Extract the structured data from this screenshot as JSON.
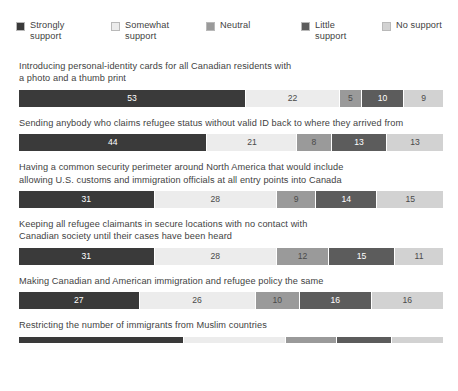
{
  "legend": {
    "items": [
      {
        "label": "Strongly\nsupport",
        "key": "strongly",
        "color": "#3a3a3a",
        "swatch_name": "legend-swatch-strongly-support"
      },
      {
        "label": "Somewhat\nsupport",
        "key": "somewhat",
        "color": "#ececec",
        "swatch_name": "legend-swatch-somewhat-support"
      },
      {
        "label": "Neutral",
        "key": "neutral",
        "color": "#9a9a9a",
        "swatch_name": "legend-swatch-neutral"
      },
      {
        "label": "Little\nsupport",
        "key": "little",
        "color": "#5c5c5c",
        "swatch_name": "legend-swatch-little-support"
      },
      {
        "label": "No support",
        "key": "nosupport",
        "color": "#d2d2d2",
        "swatch_name": "legend-swatch-no-support"
      }
    ]
  },
  "rows": [
    {
      "label": "Introducing personal-identity cards for all Canadian residents with\na photo and a thumb print",
      "values": [
        53,
        22,
        5,
        10,
        9
      ]
    },
    {
      "label": "Sending anybody who claims refugee status without valid ID back to where they arrived from",
      "values": [
        44,
        21,
        8,
        13,
        13
      ]
    },
    {
      "label": "Having a common security perimeter around North America that would include\nallowing U.S. customs and immigration officials at all entry points into Canada",
      "values": [
        31,
        28,
        9,
        14,
        15
      ]
    },
    {
      "label": "Keeping all refugee claimants in secure locations with no contact with\nCanadian society until their cases have been heard",
      "values": [
        31,
        28,
        12,
        15,
        11
      ]
    },
    {
      "label": "Making Canadian and American immigration and refugee policy the same",
      "values": [
        27,
        26,
        10,
        16,
        16
      ]
    },
    {
      "label": "Restricting the number of immigrants from Muslim countries",
      "values": [
        39,
        24,
        12,
        13,
        12
      ]
    }
  ],
  "chart_data": {
    "type": "bar",
    "orientation": "horizontal",
    "stacked": true,
    "normalized_percent": true,
    "title": "",
    "subtitle": "",
    "xlabel": "",
    "ylabel": "",
    "xlim": [
      0,
      100
    ],
    "grid": false,
    "legend_position": "top",
    "categories": [
      "Introducing personal-identity cards for all Canadian residents with a photo and a thumb print",
      "Sending anybody who claims refugee status without valid ID back to where they arrived from",
      "Having a common security perimeter around North America that would include allowing U.S. customs and immigration officials at all entry points into Canada",
      "Keeping all refugee claimants in secure locations with no contact with Canadian society until their cases have been heard",
      "Making Canadian and American immigration and refugee policy the same",
      "Restricting the number of immigrants from Muslim countries"
    ],
    "series": [
      {
        "name": "Strongly support",
        "color": "#3a3a3a",
        "values": [
          53,
          44,
          31,
          31,
          27,
          39
        ]
      },
      {
        "name": "Somewhat support",
        "color": "#ececec",
        "values": [
          22,
          21,
          28,
          28,
          26,
          24
        ]
      },
      {
        "name": "Neutral",
        "color": "#9a9a9a",
        "values": [
          5,
          8,
          9,
          12,
          10,
          12
        ]
      },
      {
        "name": "Little support",
        "color": "#5c5c5c",
        "values": [
          10,
          13,
          14,
          15,
          16,
          13
        ]
      },
      {
        "name": "No support",
        "color": "#d2d2d2",
        "values": [
          9,
          13,
          15,
          11,
          16,
          12
        ]
      }
    ]
  }
}
